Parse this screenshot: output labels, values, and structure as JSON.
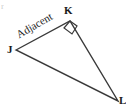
{
  "figure": {
    "type": "right-triangle-diagram",
    "stroke_color": "#3a3a3a",
    "background_color": "#ffffff",
    "label_color": "#1a1a1a",
    "vertices": [
      {
        "name": "J",
        "label": "J",
        "x": 16,
        "y": 50,
        "role": "left-acute-angle"
      },
      {
        "name": "K",
        "label": "K",
        "x": 70,
        "y": 21,
        "role": "right-angle"
      },
      {
        "name": "L",
        "label": "L",
        "x": 118,
        "y": 101,
        "role": "bottom-right-acute-angle"
      }
    ],
    "sides": [
      {
        "from": "J",
        "to": "K",
        "label": "Adjacent",
        "label_rotation_deg": -30
      },
      {
        "from": "K",
        "to": "L",
        "label": ""
      },
      {
        "from": "J",
        "to": "L",
        "label": ""
      }
    ],
    "right_angle_marker": {
      "at_vertex": "K",
      "size": 9,
      "points": "70,21 77,26 72,34 64,28"
    },
    "clipped_mark_top_left": "r"
  }
}
